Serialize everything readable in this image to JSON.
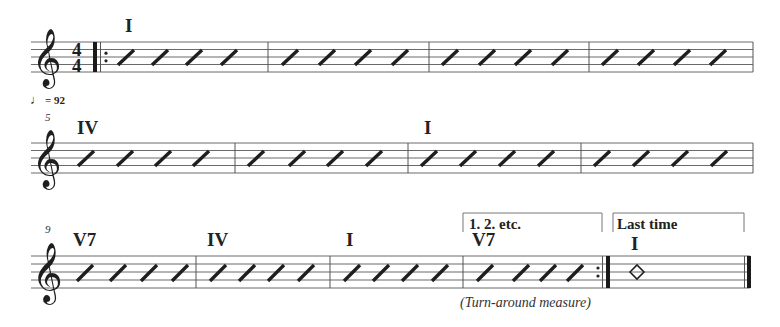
{
  "score": {
    "tempo": {
      "note_glyph": "♩",
      "text": "= 92"
    },
    "time_signature": {
      "top": "4",
      "bottom": "4"
    },
    "clef_glyph": "𝄞",
    "rows": [
      {
        "measure_number": "",
        "measures": [
          {
            "chord": "I",
            "beats": 4
          },
          {
            "chord": "",
            "beats": 4
          },
          {
            "chord": "",
            "beats": 4
          },
          {
            "chord": "",
            "beats": 4
          }
        ]
      },
      {
        "measure_number": "5",
        "measures": [
          {
            "chord": "IV",
            "beats": 4
          },
          {
            "chord": "",
            "beats": 4
          },
          {
            "chord": "I",
            "beats": 4
          },
          {
            "chord": "",
            "beats": 4
          }
        ]
      },
      {
        "measure_number": "9",
        "measures": [
          {
            "chord": "V7",
            "beats": 4
          },
          {
            "chord": "IV",
            "beats": 4
          },
          {
            "chord": "I",
            "beats": 4
          },
          {
            "chord": "V7",
            "beats": 4
          },
          {
            "chord": "I",
            "beats": 0,
            "whole_note": true
          }
        ]
      }
    ],
    "endings": [
      {
        "label": "1. 2. etc."
      },
      {
        "label": "Last time"
      }
    ],
    "annotation": "(Turn-around measure)"
  }
}
